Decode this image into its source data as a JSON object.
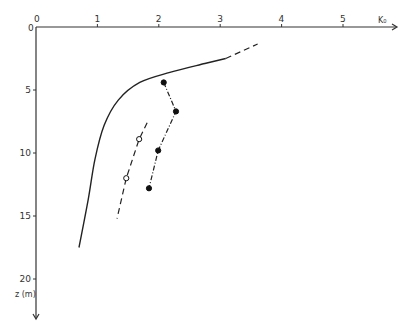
{
  "chart_data": {
    "type": "line",
    "title": "",
    "xlabel": "K0",
    "ylabel": "z (m)",
    "xlim": [
      0,
      5.8
    ],
    "ylim": [
      0,
      23
    ],
    "y_inverted": true,
    "x_axis_position": "top",
    "grid": false,
    "legend": null,
    "x_ticks": [
      "0",
      "1",
      "2",
      "3",
      "4",
      "5"
    ],
    "y_ticks": [
      "0",
      "5",
      "10",
      "15",
      "20"
    ],
    "series": [
      {
        "name": "solid-curve",
        "style": "solid",
        "marker": "none",
        "points": [
          [
            0.7,
            17.5
          ],
          [
            0.85,
            13.7
          ],
          [
            0.96,
            10.5
          ],
          [
            1.11,
            7.8
          ],
          [
            1.34,
            5.8
          ],
          [
            1.69,
            4.4
          ],
          [
            2.18,
            3.6
          ],
          [
            2.75,
            2.9
          ],
          [
            3.09,
            2.5
          ]
        ]
      },
      {
        "name": "solid-curve-extrapolation",
        "style": "dashed",
        "marker": "none",
        "points": [
          [
            3.09,
            2.5
          ],
          [
            3.61,
            1.35
          ]
        ]
      },
      {
        "name": "filled-points",
        "style": "dash-dot",
        "marker": "filled-circle",
        "points": [
          [
            2.08,
            4.4
          ],
          [
            2.28,
            6.7
          ],
          [
            1.99,
            9.8
          ],
          [
            1.84,
            12.8
          ]
        ]
      },
      {
        "name": "open-points",
        "style": "dashed",
        "marker": "open-circle",
        "points": [
          [
            1.68,
            8.9
          ],
          [
            1.47,
            12.0
          ]
        ],
        "line": [
          [
            1.81,
            7.6
          ],
          [
            1.68,
            8.9
          ],
          [
            1.47,
            12.0
          ],
          [
            1.32,
            15.2
          ]
        ]
      }
    ]
  },
  "axes": {
    "x_label": "K₀",
    "y_label": "z (m)",
    "origin_label": "0"
  }
}
